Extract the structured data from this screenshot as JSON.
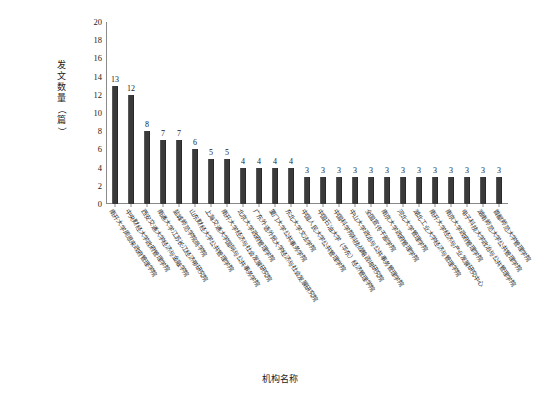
{
  "chart_data": {
    "type": "bar",
    "title": "",
    "xlabel": "机构名称",
    "ylabel": "发文数量（篇）",
    "ylim": [
      0,
      20
    ],
    "ytick_step": 2,
    "yticks": [
      0,
      2,
      4,
      6,
      8,
      10,
      12,
      14,
      16,
      18,
      20
    ],
    "grid": false,
    "legend": "none",
    "bar_color": "#3a3a3a",
    "axis_color": "#8a8a8a",
    "categories": [
      "南开大学周恩来政府管理学院",
      "中央财经大学政府管理学院",
      "西安交通大学经济与金融学院",
      "南通大学江苏长江经济带研究院",
      "盐城师范学院商学院",
      "山东财经大学公共管理学院",
      "上海交通大学国际与公共事务学院",
      "南开大学经济与社会发展研究院",
      "北京大学政府管理学院",
      "广东外语外贸大学经济与社会发展研究院",
      "厦门大学公共事务学院",
      "东北大学文法学院",
      "中国人民大学公共管理学院",
      "中国石油大学（华东）经济管理学院",
      "中国科学院科技战略咨询研究院",
      "中山大学政治与公共事务管理学院",
      "全国宣传干部学院",
      "南京大学政府管理学院",
      "河北大学管理学院",
      "湖北工业大学经济与管理学院",
      "南开大学经济与产业发展研究中心",
      "南京大学政府管理学院",
      "电子科技大学政治与公共管理学院",
      "湖南师范大学公共管理学院",
      "首都师范大学管理学院"
    ],
    "values": [
      13,
      12,
      8,
      7,
      7,
      6,
      5,
      5,
      4,
      4,
      4,
      4,
      3,
      3,
      3,
      3,
      3,
      3,
      3,
      3,
      3,
      3,
      3,
      3,
      3
    ]
  }
}
